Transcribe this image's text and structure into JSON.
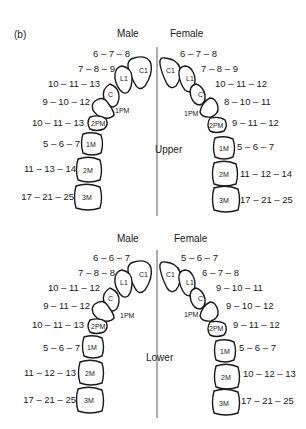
{
  "panel_label": "(b)",
  "upper": {
    "title": "Upper",
    "male_header": "Male",
    "female_header": "Female",
    "male": [
      {
        "tooth": "C1",
        "ages": "6 – 7 – 8"
      },
      {
        "tooth": "L1",
        "ages": "7 – 8 – 9"
      },
      {
        "tooth": "C",
        "ages": "10 – 11 – 13"
      },
      {
        "tooth": "1PM",
        "ages": "9 – 10 – 12"
      },
      {
        "tooth": "2PM",
        "ages": "10 – 11 – 13"
      },
      {
        "tooth": "1M",
        "ages": "5 – 6 – 7"
      },
      {
        "tooth": "2M",
        "ages": "11 – 13 – 14"
      },
      {
        "tooth": "3M",
        "ages": "17 – 21 – 25"
      }
    ],
    "female": [
      {
        "tooth": "C1",
        "ages": "6 – 7 – 8"
      },
      {
        "tooth": "L1",
        "ages": "7 – 8 – 9"
      },
      {
        "tooth": "C",
        "ages": "10 – 11 – 12"
      },
      {
        "tooth": "1PM",
        "ages": "8 – 10 – 11"
      },
      {
        "tooth": "2PM",
        "ages": "9 – 11 – 12"
      },
      {
        "tooth": "1M",
        "ages": "5 – 6 – 7"
      },
      {
        "tooth": "2M",
        "ages": "11 – 12 – 14"
      },
      {
        "tooth": "3M",
        "ages": "17 – 21 – 25"
      }
    ]
  },
  "lower": {
    "title": "Lower",
    "male_header": "Male",
    "female_header": "Female",
    "male": [
      {
        "tooth": "C1",
        "ages": "6 – 6 – 7"
      },
      {
        "tooth": "L1",
        "ages": "7 – 8 – 8"
      },
      {
        "tooth": "C",
        "ages": "10 – 11 – 12"
      },
      {
        "tooth": "1PM",
        "ages": "9 – 11 – 12"
      },
      {
        "tooth": "2PM",
        "ages": "10 – 11 – 13"
      },
      {
        "tooth": "1M",
        "ages": "5 – 6 – 7"
      },
      {
        "tooth": "2M",
        "ages": "11 – 12 – 13"
      },
      {
        "tooth": "3M",
        "ages": "17 – 21 – 25"
      }
    ],
    "female": [
      {
        "tooth": "C1",
        "ages": "5 – 6 – 7"
      },
      {
        "tooth": "L1",
        "ages": "6 – 7 – 8"
      },
      {
        "tooth": "C",
        "ages": "9 – 10 – 11"
      },
      {
        "tooth": "1PM",
        "ages": "9 – 10 – 12"
      },
      {
        "tooth": "2PM",
        "ages": "9 – 11 – 12"
      },
      {
        "tooth": "1M",
        "ages": "5 – 6 – 7"
      },
      {
        "tooth": "2M",
        "ages": "10 – 12 – 13"
      },
      {
        "tooth": "3M",
        "ages": "17 – 21 – 25"
      }
    ]
  }
}
